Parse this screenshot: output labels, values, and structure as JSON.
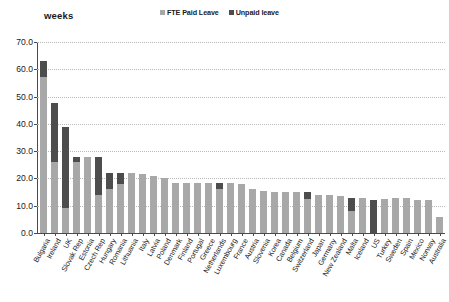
{
  "chart": {
    "y_axis_title": "weeks",
    "legend": [
      {
        "label": "FTE Paid Leave",
        "color": "#a8a8a8",
        "swatch": "paid-leave-swatch"
      },
      {
        "label": "Unpaid leave",
        "color": "#4d4d4d",
        "swatch": "unpaid-leave-swatch"
      }
    ],
    "ytick_labels": [
      "70.0",
      "60.0",
      "50.0",
      "40.0",
      "30.0",
      "20.0",
      "10.0",
      "0.0"
    ]
  },
  "chart_data": {
    "type": "bar",
    "stacked": true,
    "title": "",
    "subtitle": "",
    "xlabel": "",
    "ylabel": "weeks",
    "ylim": [
      0,
      70
    ],
    "ytick_step": 10,
    "grid": true,
    "legend_position": "top-center",
    "categories": [
      "Bulgaria",
      "Ireland",
      "UK",
      "Slovak Rep",
      "Estonia",
      "Czech Rep",
      "Hungary",
      "Romania",
      "Lithuania",
      "Italy",
      "Latvia",
      "Poland",
      "Denmark",
      "Finland",
      "Portugal",
      "Greece",
      "Netherlands",
      "Luxembourg",
      "France",
      "Austria",
      "Slovenia",
      "Korea",
      "Canada",
      "Belgium",
      "Switzerland",
      "Japan",
      "Germany",
      "New Zealand",
      "Malta",
      "Iceland",
      "US",
      "Turkey",
      "Sweden",
      "Spain",
      "Mexico",
      "Norway",
      "Australia"
    ],
    "series": [
      {
        "name": "FTE Paid Leave",
        "color": "#a8a8a8",
        "values": [
          57.0,
          26.0,
          9.0,
          26.0,
          28.0,
          14.0,
          16.0,
          18.0,
          22.0,
          21.5,
          21.0,
          20.0,
          18.5,
          18.5,
          18.5,
          18.5,
          16.0,
          18.5,
          18.0,
          16.0,
          15.5,
          15.0,
          15.0,
          15.0,
          12.5,
          14.0,
          14.0,
          13.5,
          8.0,
          13.0,
          0.0,
          12.5,
          13.0,
          13.0,
          12.0,
          12.0,
          6.0
        ]
      },
      {
        "name": "Unpaid leave",
        "color": "#4d4d4d",
        "values": [
          6.0,
          21.5,
          30.0,
          2.0,
          0.0,
          14.0,
          6.0,
          4.0,
          0.0,
          0.0,
          0.0,
          0.0,
          0.0,
          0.0,
          0.0,
          0.0,
          2.5,
          0.0,
          0.0,
          0.0,
          0.0,
          0.0,
          0.0,
          0.0,
          2.5,
          0.0,
          0.0,
          0.0,
          5.0,
          0.0,
          12.0,
          0.0,
          0.0,
          0.0,
          0.0,
          0.0,
          0.0
        ]
      }
    ]
  }
}
